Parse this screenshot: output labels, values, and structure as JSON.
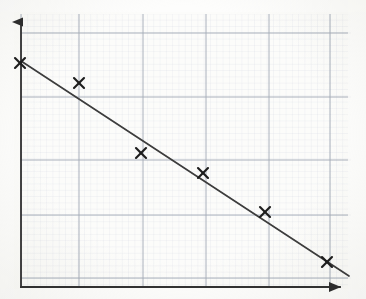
{
  "figure": {
    "title": "",
    "medium": "scanned-graph-paper",
    "width": 366,
    "height": 299,
    "paper_color": "#fcfcfa",
    "axis_color": "#3a3a3a",
    "major_grid_color": "#9aa3b0",
    "minor_grid_color": "#cdd4e0",
    "marker_color": "#1c1c1c",
    "trendline_color": "#3c3c3c"
  },
  "axes": {
    "x_axis": {
      "label": "",
      "origin_px": {
        "x": 21,
        "y": 287
      },
      "end_px": {
        "x": 352,
        "y": 287
      },
      "arrowhead": "right",
      "tick_labels": [],
      "show_labels": false
    },
    "y_axis": {
      "label": "",
      "origin_px": {
        "x": 21,
        "y": 287
      },
      "end_px": {
        "x": 21,
        "y": 10
      },
      "arrowhead": "up",
      "tick_labels": [],
      "show_labels": false
    },
    "grid": {
      "major_vertical_px": [
        21,
        79,
        143,
        206,
        269,
        330
      ],
      "major_horizontal_px": [
        33,
        97,
        160,
        215,
        278
      ],
      "minor_spacing_px": 6.3,
      "visible": true
    }
  },
  "chart_data": {
    "type": "scatter",
    "title": "",
    "subtitle": "",
    "xlabel": "",
    "ylabel": "",
    "xlim": [
      0,
      6
    ],
    "ylim": [
      0,
      5
    ],
    "grid": true,
    "legend": null,
    "legend_position": "none",
    "axis_tick_labels_shown": false,
    "marker_style": "x",
    "series": [
      {
        "name": "Data points",
        "marker": "x",
        "color": "#1c1c1c",
        "points_px": [
          {
            "x": 20,
            "y": 63
          },
          {
            "x": 79,
            "y": 83
          },
          {
            "x": 141,
            "y": 153
          },
          {
            "x": 203,
            "y": 173
          },
          {
            "x": 265,
            "y": 212
          },
          {
            "x": 327,
            "y": 262
          }
        ],
        "x": [
          0.0,
          1.0,
          2.0,
          3.0,
          4.0,
          5.0
        ],
        "y": [
          4.3,
          3.9,
          2.6,
          2.2,
          1.5,
          0.5
        ]
      }
    ],
    "trendline": {
      "name": "Line of best fit",
      "type": "linear",
      "color": "#3c3c3c",
      "start_px": {
        "x": 21,
        "y": 61
      },
      "end_px": {
        "x": 349,
        "y": 276
      },
      "slope_per_unit": -0.76,
      "intercept": 4.35
    },
    "annotations": []
  }
}
